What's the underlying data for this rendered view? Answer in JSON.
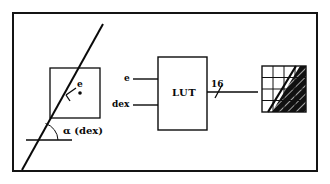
{
  "figure": {
    "border_color": "#141414",
    "background": "#ffffff",
    "ink_color": "#0a0a0a"
  },
  "left_panel": {
    "name": "edge-geometry-panel",
    "square_label": "e",
    "angle_label": "α  (dex)",
    "description": "A straight edge line crossing a square pixel region, with angle alpha measured from the horizontal baseline"
  },
  "middle_panel": {
    "name": "lut-block",
    "block_label": "LUT",
    "inputs": [
      {
        "label": "e"
      },
      {
        "label": "dex"
      }
    ],
    "output": {
      "bus_width_label": "16"
    }
  },
  "right_panel": {
    "name": "coverage-grid",
    "rows": 4,
    "cols": 4,
    "cell_states": [
      [
        "white",
        "white",
        "hatch",
        "hatch"
      ],
      [
        "white",
        "white",
        "hatch",
        "hatch"
      ],
      [
        "white",
        "hatch",
        "hatch",
        "hatch"
      ],
      [
        "hatch",
        "hatch",
        "hatch",
        "hatch"
      ]
    ],
    "fill_color": "#111111",
    "empty_color": "#ffffff"
  }
}
